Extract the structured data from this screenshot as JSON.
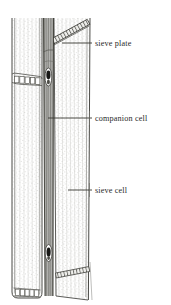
{
  "figure": {
    "name": "phloem-sieve-cell-diagram",
    "background_color": "#ffffff",
    "ink_color": "#3a3a3a",
    "stipple_color": "#9a9a95",
    "nucleus_color": "#1c1c1c"
  },
  "labels": [
    {
      "id": "sieve-plate",
      "text": "sieve plate",
      "text_x": 95,
      "text_y": 46,
      "leader_x1": 62,
      "leader_y1": 43,
      "leader_x2": 92,
      "leader_y2": 43,
      "tick_top": 36,
      "tick_bottom": 50
    },
    {
      "id": "companion-cell",
      "text": "companion cell",
      "text_x": 95,
      "text_y": 121,
      "leader_x1": 48,
      "leader_y1": 118,
      "leader_x2": 92,
      "leader_y2": 118,
      "tick_top": 111,
      "tick_bottom": 125
    },
    {
      "id": "sieve-cell",
      "text": "sieve cell",
      "text_x": 95,
      "text_y": 193,
      "leader_x1": 68,
      "leader_y1": 190,
      "leader_x2": 92,
      "leader_y2": 190,
      "tick_top": 183,
      "tick_bottom": 197
    }
  ],
  "structures": {
    "left_sieve_cell": {
      "name": "left-sieve-cell",
      "sieve_plate_y": 78,
      "pore_count": 5
    },
    "right_sieve_cell": {
      "name": "right-sieve-cell",
      "diagonal_plate_from": [
        52,
        44
      ],
      "diagonal_plate_to": [
        88,
        24
      ]
    },
    "companion_cell": {
      "name": "companion-cell-strip",
      "x_left": 44,
      "x_right": 53,
      "nucleus_upper_y": 77,
      "nucleus_lower_y": 253
    },
    "bottom_plates": {
      "name": "bottom-sieve-plates",
      "left_y": 291,
      "right_y": 272
    }
  }
}
